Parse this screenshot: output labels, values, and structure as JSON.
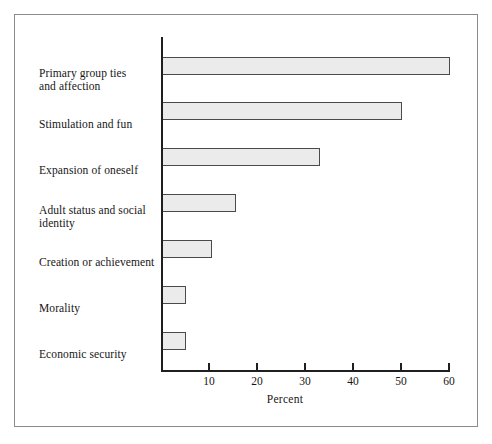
{
  "figure": {
    "frame_color": "#8a8a8a",
    "background": "#ffffff"
  },
  "chart_data": {
    "type": "bar",
    "orientation": "horizontal",
    "title": "",
    "subtitle": "",
    "xlabel": "Percent",
    "ylabel": "",
    "categories": [
      "Primary group ties and affection",
      "Stimulation and fun",
      "Expansion of oneself",
      "Adult status and social identity",
      "Creation or achievement",
      "Morality",
      "Economic security"
    ],
    "values": [
      60,
      50,
      33,
      15.5,
      10.5,
      5.2,
      5.2
    ],
    "xlim": [
      0,
      60
    ],
    "xticks": [
      10,
      20,
      30,
      40,
      50,
      60
    ],
    "xtick_labels": [
      "10",
      "20",
      "30",
      "40",
      "50",
      "60"
    ],
    "grid": false,
    "legend": null,
    "bar_fill": "#ebebeb",
    "bar_edge": "#4a4a4a",
    "axis_color": "#1f1f1f"
  },
  "labels": {
    "lines": [
      [
        "Primary group ties",
        "and affection"
      ],
      [
        "Stimulation and fun"
      ],
      [
        "Expansion of oneself"
      ],
      [
        "Adult status and social",
        "identity"
      ],
      [
        "Creation or achievement"
      ],
      [
        "Morality"
      ],
      [
        "Economic security"
      ]
    ]
  }
}
